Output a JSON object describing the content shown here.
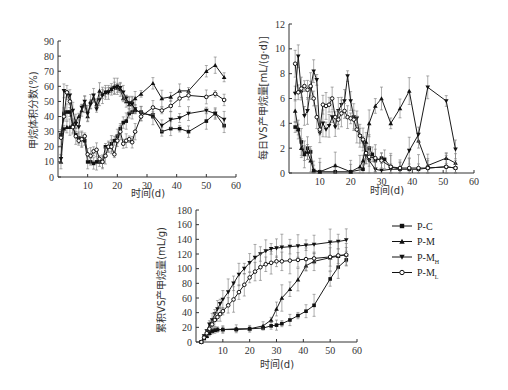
{
  "chart_data": [
    {
      "id": "chart1",
      "type": "line",
      "title": "",
      "xlabel": "时间(d)",
      "ylabel": "甲烷体积分数(%)",
      "xlim": [
        0,
        60
      ],
      "ylim": [
        0,
        90
      ],
      "xticks": [
        10,
        20,
        30,
        40,
        50,
        60
      ],
      "yticks": [
        0,
        10,
        20,
        30,
        40,
        50,
        60,
        70,
        80,
        90
      ],
      "grid": false,
      "series": [
        {
          "name": "P-C",
          "marker": "square",
          "x": [
            1,
            2,
            3,
            4,
            5,
            6,
            7,
            8,
            9,
            10,
            11,
            12,
            13,
            14,
            15,
            16,
            17,
            18,
            19,
            20,
            21,
            22,
            23,
            24,
            25,
            26,
            28,
            32,
            35,
            38,
            41,
            44,
            50,
            53,
            56
          ],
          "y": [
            28,
            42,
            43,
            43,
            33,
            28,
            26,
            25,
            24,
            10,
            10,
            9,
            10,
            10,
            10,
            20,
            20,
            22,
            24,
            27,
            32,
            36,
            37,
            42,
            43,
            44,
            43,
            40,
            30,
            32,
            32,
            30,
            37,
            42,
            34
          ]
        },
        {
          "name": "P-M",
          "marker": "triangle-up",
          "x": [
            1,
            2,
            3,
            4,
            5,
            6,
            7,
            8,
            9,
            10,
            11,
            12,
            13,
            14,
            15,
            16,
            17,
            18,
            19,
            20,
            21,
            22,
            23,
            24,
            25,
            26,
            28,
            32,
            35,
            38,
            41,
            44,
            50,
            53,
            56
          ],
          "y": [
            10,
            32,
            33,
            33,
            35,
            37,
            40,
            44,
            48,
            40,
            50,
            52,
            48,
            57,
            55,
            56,
            57,
            58,
            60,
            59,
            58,
            52,
            50,
            48,
            50,
            52,
            55,
            62,
            52,
            53,
            57,
            57,
            70,
            74,
            66
          ]
        },
        {
          "name": "P-MH",
          "marker": "triangle-down",
          "x": [
            1,
            2,
            3,
            4,
            5,
            6,
            7,
            8,
            9,
            10,
            11,
            12,
            13,
            14,
            15,
            16,
            17,
            18,
            19,
            20,
            21,
            22,
            23,
            24,
            25,
            26,
            28,
            32,
            35,
            38,
            41,
            44,
            50,
            53,
            56
          ],
          "y": [
            12,
            57,
            55,
            54,
            44,
            35,
            33,
            46,
            50,
            42,
            48,
            54,
            45,
            51,
            54,
            56,
            56,
            58,
            59,
            60,
            59,
            56,
            52,
            49,
            48,
            45,
            42,
            41,
            34,
            38,
            39,
            42,
            44,
            42,
            38
          ]
        },
        {
          "name": "P-ML",
          "marker": "circle-open",
          "x": [
            1,
            2,
            3,
            4,
            5,
            6,
            7,
            8,
            9,
            10,
            11,
            12,
            13,
            14,
            15,
            16,
            17,
            18,
            19,
            20,
            21,
            22,
            23,
            24,
            25,
            26,
            28,
            32,
            35,
            38,
            41,
            44,
            50,
            53,
            56
          ],
          "y": [
            26,
            40,
            56,
            50,
            33,
            27,
            24,
            25,
            27,
            15,
            14,
            17,
            18,
            12,
            10,
            14,
            20,
            20,
            15,
            24,
            30,
            22,
            24,
            25,
            23,
            30,
            40,
            46,
            44,
            47,
            52,
            54,
            53,
            55,
            51
          ]
        }
      ]
    },
    {
      "id": "chart2",
      "type": "line",
      "title": "",
      "xlabel": "时间(d)",
      "ylabel": "每日VS产甲烷量[mL/(g·d)]",
      "xlim": [
        0,
        60
      ],
      "ylim": [
        0,
        12
      ],
      "xticks": [
        10,
        20,
        30,
        40,
        50,
        60
      ],
      "yticks": [
        0,
        2,
        4,
        6,
        8,
        10,
        12
      ],
      "grid": false,
      "series": [
        {
          "name": "P-C",
          "marker": "square",
          "x": [
            2,
            3,
            4,
            5,
            6,
            7,
            8,
            10,
            15,
            20,
            24,
            25,
            26,
            27,
            28,
            30,
            31,
            33,
            36,
            39,
            42,
            45,
            51,
            54
          ],
          "y": [
            3.7,
            3.5,
            2.5,
            1.6,
            2.0,
            1.7,
            0.2,
            0.1,
            0.1,
            0.1,
            0.3,
            1.5,
            2.0,
            1.5,
            1.0,
            1.2,
            1.1,
            0.5,
            0.3,
            0.3,
            0.3,
            0.4,
            0.5,
            0.4
          ]
        },
        {
          "name": "P-M",
          "marker": "triangle-up",
          "x": [
            2,
            3,
            4,
            5,
            6,
            7,
            8,
            10,
            15,
            20,
            23,
            24,
            25,
            26,
            28,
            30,
            33,
            36,
            39,
            42,
            45,
            51,
            54
          ],
          "y": [
            5.0,
            3.5,
            2.0,
            1.5,
            1.7,
            1.0,
            0.2,
            0.1,
            0.6,
            0.1,
            0.5,
            1.0,
            2.5,
            4.0,
            5.4,
            6.0,
            4.0,
            5.2,
            6.6,
            2.6,
            0.6,
            1.2,
            0.8
          ]
        },
        {
          "name": "P-MH",
          "marker": "triangle-down",
          "x": [
            2,
            3,
            4,
            5,
            6,
            7,
            8,
            9,
            10,
            11,
            12,
            13,
            14,
            15,
            16,
            17,
            18,
            19,
            20,
            21,
            22,
            23,
            24,
            25,
            26,
            28,
            30,
            33,
            36,
            39,
            42,
            45,
            51,
            54
          ],
          "y": [
            6.4,
            9.4,
            6.5,
            4.6,
            5.0,
            6.8,
            8.2,
            7.5,
            3.2,
            4.0,
            3.5,
            3.8,
            4.5,
            3.7,
            5.0,
            5.5,
            5.8,
            7.8,
            5.8,
            4.5,
            4.4,
            3.0,
            2.5,
            1.5,
            1.0,
            0.3,
            0.2,
            0.3,
            0.3,
            1.8,
            3.1,
            6.9,
            5.8,
            1.9
          ]
        },
        {
          "name": "P-ML",
          "marker": "circle-open",
          "x": [
            2,
            3,
            4,
            5,
            6,
            7,
            8,
            9,
            10,
            11,
            12,
            13,
            14,
            15,
            16,
            17,
            18,
            19,
            20,
            21,
            22,
            23,
            24,
            25,
            26,
            28,
            30,
            33,
            36,
            39,
            42,
            45,
            51,
            54
          ],
          "y": [
            8.8,
            6.5,
            6.8,
            7.0,
            6.7,
            7.0,
            6.0,
            4.5,
            3.5,
            5.5,
            5.4,
            5.5,
            6.0,
            4.5,
            4.3,
            4.8,
            5.0,
            4.5,
            4.4,
            4.3,
            3.5,
            3.0,
            2.7,
            1.6,
            1.3,
            1.2,
            1.0,
            0.5,
            0.4,
            0.4,
            0.4,
            0.4,
            0.5,
            0.4
          ]
        }
      ]
    },
    {
      "id": "chart3",
      "type": "line",
      "title": "",
      "xlabel": "时间(d)",
      "ylabel": "累积VS产甲烷量(mL/g)",
      "xlim": [
        0,
        60
      ],
      "ylim": [
        0,
        180
      ],
      "xticks": [
        10,
        20,
        30,
        40,
        50,
        60
      ],
      "yticks": [
        0,
        20,
        40,
        60,
        80,
        100,
        120,
        140,
        160,
        180
      ],
      "grid": false,
      "series": [
        {
          "name": "P-C",
          "marker": "square",
          "x": [
            2,
            3,
            4,
            5,
            6,
            7,
            8,
            10,
            15,
            20,
            25,
            28,
            30,
            32,
            35,
            38,
            41,
            44,
            50,
            53,
            56
          ],
          "y": [
            0,
            5,
            8,
            12,
            15,
            16,
            17,
            17,
            17,
            18,
            19,
            22,
            23,
            25,
            30,
            36,
            42,
            50,
            86,
            102,
            112
          ]
        },
        {
          "name": "P-M",
          "marker": "triangle-up",
          "x": [
            2,
            3,
            4,
            5,
            6,
            7,
            8,
            10,
            15,
            20,
            25,
            28,
            30,
            32,
            35,
            38,
            41,
            44,
            50,
            53,
            56
          ],
          "y": [
            0,
            5,
            8,
            12,
            15,
            16,
            17,
            17,
            18,
            18,
            22,
            30,
            45,
            60,
            72,
            85,
            104,
            110,
            115,
            117,
            119
          ]
        },
        {
          "name": "P-MH",
          "marker": "triangle-down",
          "x": [
            2,
            3,
            4,
            5,
            6,
            7,
            8,
            9,
            10,
            12,
            14,
            16,
            18,
            20,
            22,
            24,
            26,
            28,
            30,
            32,
            35,
            38,
            41,
            44,
            50,
            53,
            56
          ],
          "y": [
            0,
            8,
            15,
            24,
            30,
            38,
            45,
            52,
            58,
            68,
            80,
            92,
            100,
            108,
            115,
            120,
            124,
            127,
            128,
            129,
            130,
            131,
            132,
            133,
            136,
            137,
            139
          ]
        },
        {
          "name": "P-ML",
          "marker": "circle-open",
          "x": [
            2,
            3,
            4,
            5,
            6,
            7,
            8,
            9,
            10,
            12,
            14,
            16,
            18,
            20,
            22,
            24,
            26,
            28,
            30,
            32,
            35,
            38,
            41,
            44,
            50,
            53,
            56
          ],
          "y": [
            0,
            6,
            12,
            18,
            24,
            30,
            34,
            38,
            42,
            50,
            58,
            68,
            78,
            88,
            96,
            102,
            106,
            108,
            110,
            110,
            111,
            112,
            113,
            114,
            116,
            118,
            119
          ]
        }
      ]
    }
  ],
  "legend": {
    "items": [
      {
        "label": "P-C",
        "marker": "square"
      },
      {
        "label": "P-M",
        "marker": "triangle-up"
      },
      {
        "label": "P-M",
        "sub": "H",
        "marker": "triangle-down"
      },
      {
        "label": "P-M",
        "sub": "L",
        "marker": "circle-open"
      }
    ]
  },
  "colors": {
    "line": "#1a1a1a",
    "axis": "#333333",
    "error_bar": "#777777",
    "background": "#ffffff"
  }
}
